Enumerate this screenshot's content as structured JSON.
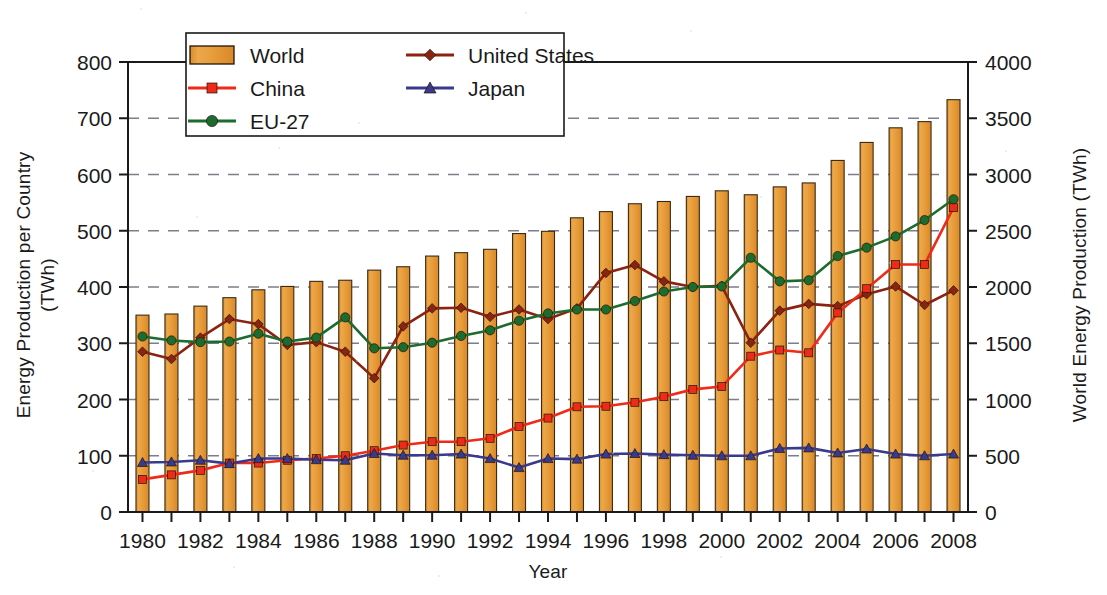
{
  "chart_data": {
    "type": "bar",
    "title": "",
    "xlabel": "Year",
    "ylabel": "Energy Production per Country (TWh)",
    "ylabel_line1": "Energy Production per Country",
    "ylabel_line2": "(TWh)",
    "y2label": "World Energy Production (TWh)",
    "grid": true,
    "legend_position": "top-center",
    "ylim": [
      0,
      800
    ],
    "y2lim": [
      0,
      4000
    ],
    "yticks": [
      0,
      100,
      200,
      300,
      400,
      500,
      600,
      700,
      800
    ],
    "y2ticks": [
      0,
      500,
      1000,
      1500,
      2000,
      2500,
      3000,
      3500,
      4000
    ],
    "xlim": [
      1979.5,
      2008.5
    ],
    "xticks": [
      1980,
      1981,
      1982,
      1983,
      1984,
      1985,
      1986,
      1987,
      1988,
      1989,
      1990,
      1991,
      1992,
      1993,
      1994,
      1995,
      1996,
      1997,
      1998,
      1999,
      2000,
      2001,
      2002,
      2003,
      2004,
      2005,
      2006,
      2007,
      2008
    ],
    "xticklabels": [
      "1980",
      "",
      "1982",
      "",
      "1984",
      "",
      "1986",
      "",
      "1988",
      "",
      "1990",
      "",
      "1992",
      "",
      "1994",
      "",
      "1996",
      "",
      "1998",
      "",
      "2000",
      "",
      "2002",
      "",
      "2004",
      "",
      "2006",
      "",
      "2008"
    ],
    "x": [
      1980,
      1981,
      1982,
      1983,
      1984,
      1985,
      1986,
      1987,
      1988,
      1989,
      1990,
      1991,
      1992,
      1993,
      1994,
      1995,
      1996,
      1997,
      1998,
      1999,
      2000,
      2001,
      2002,
      2003,
      2004,
      2005,
      2006,
      2007,
      2008
    ],
    "categories": [
      "1980",
      "1981",
      "1982",
      "1983",
      "1984",
      "1985",
      "1986",
      "1987",
      "1988",
      "1989",
      "1990",
      "1991",
      "1992",
      "1993",
      "1994",
      "1995",
      "1996",
      "1997",
      "1998",
      "1999",
      "2000",
      "2001",
      "2002",
      "2003",
      "2004",
      "2005",
      "2006",
      "2007",
      "2008"
    ],
    "bar_series": {
      "name": "World",
      "axis": "right",
      "unit": "TWh",
      "color": "#E8A03C",
      "values_right_axis": [
        1750,
        1760,
        1830,
        1905,
        1975,
        2005,
        2050,
        2060,
        2150,
        2180,
        2275,
        2305,
        2335,
        2475,
        2495,
        2615,
        2670,
        2740,
        2760,
        2805,
        2855,
        2820,
        2890,
        2925,
        3125,
        3285,
        3415,
        3470,
        3665
      ],
      "values_left_axis_scale": [
        350,
        352,
        366,
        381,
        395,
        401,
        410,
        412,
        430,
        436,
        455,
        461,
        467,
        495,
        499,
        523,
        534,
        548,
        552,
        561,
        571,
        564,
        578,
        585,
        625,
        657,
        683,
        694,
        733
      ]
    },
    "series": [
      {
        "name": "United States",
        "color": "#8B2311",
        "marker": "diamond",
        "axis": "left",
        "values": [
          285,
          272,
          310,
          343,
          334,
          297,
          302,
          285,
          238,
          330,
          362,
          363,
          347,
          360,
          343,
          362,
          425,
          439,
          410,
          400,
          402,
          301,
          358,
          370,
          366,
          387,
          401,
          368,
          394
        ]
      },
      {
        "name": "China",
        "color": "#EE2B18",
        "marker": "square",
        "axis": "left",
        "values": [
          58,
          66,
          74,
          87,
          87,
          92,
          95,
          100,
          109,
          119,
          125,
          125,
          131,
          152,
          167,
          187,
          188,
          195,
          205,
          218,
          223,
          277,
          288,
          283,
          354,
          397,
          440,
          440,
          541
        ]
      },
      {
        "name": "EU-27",
        "color": "#1E6B2E",
        "marker": "circle",
        "axis": "left",
        "values": [
          312,
          305,
          302,
          303,
          317,
          303,
          310,
          346,
          291,
          293,
          301,
          313,
          323,
          340,
          353,
          360,
          360,
          375,
          392,
          400,
          401,
          452,
          410,
          412,
          455,
          470,
          490,
          519,
          556
        ]
      },
      {
        "name": "Japan",
        "color": "#3A3A8C",
        "marker": "triangle",
        "axis": "left",
        "values": [
          88,
          89,
          92,
          86,
          95,
          95,
          93,
          92,
          104,
          101,
          101,
          103,
          95,
          79,
          95,
          94,
          103,
          104,
          102,
          101,
          100,
          100,
          113,
          114,
          105,
          112,
          103,
          100,
          103
        ]
      }
    ],
    "legend": [
      {
        "label": "World",
        "color": "#E8A03C",
        "type": "bar"
      },
      {
        "label": "United States",
        "color": "#8B2311",
        "type": "line",
        "marker": "diamond"
      },
      {
        "label": "China",
        "color": "#EE2B18",
        "type": "line",
        "marker": "square"
      },
      {
        "label": "Japan",
        "color": "#3A3A8C",
        "type": "line",
        "marker": "triangle"
      },
      {
        "label": "EU-27",
        "color": "#1E6B2E",
        "type": "line",
        "marker": "circle"
      }
    ]
  }
}
